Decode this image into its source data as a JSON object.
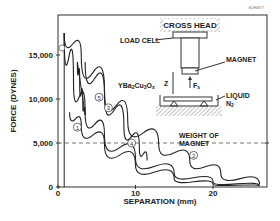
{
  "figure_id": "SCH4877",
  "chart_data": {
    "type": "line",
    "title": "",
    "xlabel": "SEPARATION (mm)",
    "ylabel": "FORCE (DYNES)",
    "xlim": [
      0,
      27
    ],
    "ylim": [
      0,
      18500
    ],
    "x_ticks": [
      "0",
      "10",
      "20"
    ],
    "y_ticks": [
      "0",
      "5,000",
      "10,000",
      "15,000"
    ],
    "grid": false,
    "reference_line": {
      "y": 5000,
      "label": "WEIGHT OF MAGNET",
      "style": "dashed"
    },
    "curve_labels": [
      "1",
      "2",
      "3",
      "4",
      "5"
    ],
    "series": [
      {
        "name": "1",
        "points": [
          [
            0.8,
            17500
          ],
          [
            2,
            12000
          ],
          [
            3.5,
            8500
          ],
          [
            6,
            5800
          ],
          [
            10,
            3200
          ],
          [
            15,
            1500
          ],
          [
            20,
            600
          ],
          [
            26,
            100
          ]
        ]
      },
      {
        "name": "2",
        "points": [
          [
            0.8,
            17500
          ],
          [
            3,
            15000
          ],
          [
            6,
            11000
          ],
          [
            9,
            7500
          ],
          [
            13,
            4800
          ],
          [
            17,
            3000
          ],
          [
            21,
            1600
          ],
          [
            26,
            300
          ]
        ]
      },
      {
        "name": "3",
        "points": [
          [
            1.5,
            8500
          ],
          [
            3,
            7000
          ],
          [
            6,
            4800
          ],
          [
            10,
            2500
          ],
          [
            15,
            900
          ],
          [
            20,
            300
          ],
          [
            26,
            100
          ]
        ]
      },
      {
        "name": "4",
        "points": [
          [
            3.5,
            14200
          ],
          [
            6,
            10500
          ],
          [
            8.5,
            7000
          ],
          [
            10.5,
            4500
          ],
          [
            11.5,
            3000
          ]
        ]
      },
      {
        "name": "5",
        "points": [
          [
            2.5,
            14200
          ],
          [
            2.8,
            12000
          ],
          [
            3.2,
            9500
          ],
          [
            3.5,
            8200
          ]
        ]
      }
    ]
  },
  "diagram": {
    "cross_head": "CROSS HEAD",
    "load_cell": "LOAD CELL",
    "magnet": "MAGNET",
    "sample": "YBa2Cu3Ox",
    "z_label": "Z",
    "force_label": "Fs",
    "liquid": "LIQUID",
    "n2": "N2"
  }
}
